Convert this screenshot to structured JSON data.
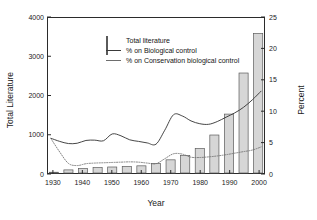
{
  "chart_data": {
    "type": "bar",
    "title": "",
    "subtitle": "",
    "xlabel": "Year",
    "ylabel": "Total Literature",
    "y2label": "Percent",
    "xlim": [
      1928,
      2002
    ],
    "ylim": [
      0,
      4000
    ],
    "y2lim": [
      0,
      25
    ],
    "grid": false,
    "legend_position": "top-left",
    "x_ticks": [
      1930,
      1940,
      1950,
      1960,
      1970,
      1980,
      1990,
      2000
    ],
    "x_tick_labels": [
      "1930",
      "1940",
      "1950",
      "1960",
      "1970",
      "1980",
      "1990",
      "2000"
    ],
    "y_ticks": [
      0,
      1000,
      2000,
      3000,
      4000
    ],
    "y_tick_labels": [
      "0",
      "1000",
      "2000",
      "3000",
      "4000"
    ],
    "y2_ticks": [
      0,
      5,
      10,
      15,
      20,
      25
    ],
    "y2_tick_labels": [
      "0",
      "5",
      "10",
      "15",
      "20",
      "25"
    ],
    "categories": [
      1930,
      1935,
      1940,
      1945,
      1950,
      1955,
      1960,
      1965,
      1970,
      1975,
      1980,
      1985,
      1990,
      1995,
      2000
    ],
    "series": [
      {
        "name": "Total literature",
        "type": "bar",
        "axis": "left",
        "color": "#d6d6d6",
        "edge_color": "#5a5a5a",
        "values": [
          20,
          80,
          115,
          140,
          155,
          170,
          185,
          245,
          340,
          450,
          630,
          980,
          1520,
          2580,
          3600
        ]
      },
      {
        "name": "% on Biological control",
        "type": "line",
        "axis": "right",
        "style": "solid",
        "color": "#3a3a3a",
        "x": [
          1929,
          1932,
          1935,
          1938,
          1941,
          1944,
          1947,
          1950,
          1953,
          1956,
          1959,
          1962,
          1965,
          1968,
          1971,
          1974,
          1977,
          1980,
          1983,
          1986,
          1989,
          1992,
          1995,
          1998,
          2001
        ],
        "values": [
          5.6,
          5.1,
          4.75,
          4.8,
          5.25,
          5.3,
          5.2,
          6.3,
          6.0,
          5.35,
          5.1,
          4.85,
          4.65,
          6.9,
          9.4,
          9.2,
          8.4,
          7.95,
          7.85,
          8.3,
          9.0,
          9.7,
          10.6,
          11.8,
          13.2
        ]
      },
      {
        "name": "% on Conservation biological control",
        "type": "line",
        "axis": "right",
        "style": "dotted",
        "color": "#6e6e6e",
        "x": [
          1929,
          1932,
          1935,
          1938,
          1941,
          1944,
          1947,
          1950,
          1953,
          1956,
          1959,
          1962,
          1965,
          1968,
          1971,
          1974,
          1977,
          1980,
          1983,
          1986,
          1989,
          1992,
          1995,
          1998,
          2001
        ],
        "values": [
          5.55,
          3.4,
          1.55,
          1.2,
          1.5,
          1.6,
          1.65,
          1.7,
          1.75,
          1.8,
          1.75,
          1.6,
          1.5,
          2.3,
          3.1,
          3.05,
          2.55,
          2.5,
          2.6,
          2.75,
          2.95,
          3.2,
          3.45,
          3.7,
          4.2
        ]
      }
    ]
  },
  "legend": {
    "items": [
      {
        "label": "Total literature",
        "key": "swatch"
      },
      {
        "label": "% on Biological control",
        "key": "solid-line"
      },
      {
        "label": "% on Conservation biological control",
        "key": "thin-line"
      }
    ]
  }
}
